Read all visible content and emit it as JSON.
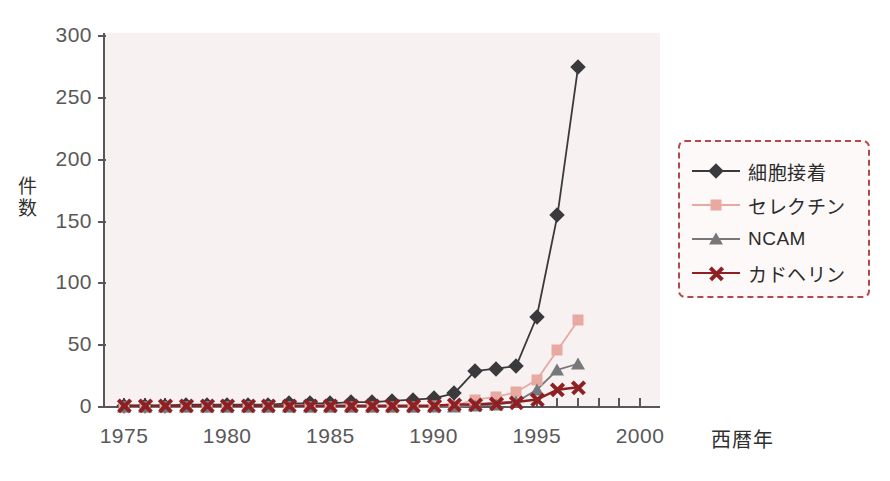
{
  "chart_data": {
    "type": "line",
    "title": "",
    "subtitle": "",
    "xlabel": "西暦年",
    "ylabel": "件数",
    "xlim": [
      1975,
      2001
    ],
    "ylim": [
      0,
      310
    ],
    "yticks": [
      0,
      50,
      100,
      150,
      200,
      250,
      300
    ],
    "xticks": [
      1975,
      1976,
      1977,
      1978,
      1979,
      1980,
      1981,
      1982,
      1983,
      1984,
      1985,
      1986,
      1987,
      1988,
      1989,
      1990,
      1991,
      1992,
      1993,
      1994,
      1995,
      1996,
      1997,
      1998,
      1999,
      2000
    ],
    "xtick_labels": [
      {
        "year": 1975,
        "label": "1975"
      },
      {
        "year": 1980,
        "label": "1980"
      },
      {
        "year": 1985,
        "label": "1985"
      },
      {
        "year": 1990,
        "label": "1990"
      },
      {
        "year": 1995,
        "label": "1995"
      },
      {
        "year": 2000,
        "label": "2000"
      }
    ],
    "grid": false,
    "legend_position": "right",
    "x": [
      1975,
      1976,
      1977,
      1978,
      1979,
      1980,
      1981,
      1982,
      1983,
      1984,
      1985,
      1986,
      1987,
      1988,
      1989,
      1990,
      1991,
      1992,
      1993,
      1994,
      1995,
      1996,
      1997,
      1998
    ],
    "series": [
      {
        "name": "細胞接着",
        "marker": "diamond",
        "color": "#3a3a3c",
        "values": [
          1,
          1,
          1,
          2,
          2,
          2,
          2,
          2,
          3,
          3,
          3,
          4,
          4,
          5,
          6,
          7,
          11,
          29,
          31,
          33,
          73,
          155,
          275,
          null
        ]
      },
      {
        "name": "セレクチン",
        "marker": "square",
        "color": "#e8a9a2",
        "values": [
          0,
          0,
          0,
          0,
          0,
          0,
          0,
          0,
          0,
          0,
          0,
          0,
          0,
          0,
          0,
          1,
          1,
          6,
          8,
          12,
          22,
          46,
          70,
          null
        ]
      },
      {
        "name": "NCAM",
        "marker": "triangle",
        "color": "#78787a",
        "values": [
          0,
          0,
          0,
          0,
          0,
          0,
          0,
          0,
          0,
          0,
          0,
          0,
          0,
          0,
          0,
          0,
          0,
          1,
          2,
          4,
          14,
          30,
          35,
          null
        ]
      },
      {
        "name": "カドヘリン",
        "marker": "x",
        "color": "#8e1f22",
        "values": [
          1,
          1,
          1,
          1,
          1,
          1,
          1,
          1,
          1,
          1,
          1,
          1,
          1,
          1,
          1,
          1,
          2,
          2,
          3,
          4,
          6,
          14,
          16,
          null
        ]
      }
    ]
  },
  "axis": {
    "ylabel": "件数",
    "xlabel": "西暦年"
  },
  "legend": {
    "items": [
      {
        "label": "細胞接着",
        "marker": "diamond-icon",
        "color": "#3a3a3c"
      },
      {
        "label": "セレクチン",
        "marker": "square-icon",
        "color": "#e8a9a2"
      },
      {
        "label": "NCAM",
        "marker": "triangle-icon",
        "color": "#78787a"
      },
      {
        "label": "カドヘリン",
        "marker": "x-icon",
        "color": "#8e1f22"
      }
    ]
  },
  "colors": {
    "plot_background": "#f8f1f1",
    "axis": "#58585a",
    "legend_border": "#b5484a",
    "page_background": "#ffffff"
  }
}
